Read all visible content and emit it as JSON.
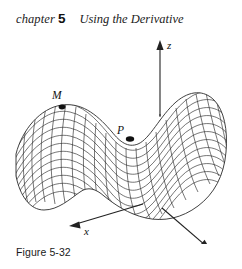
{
  "header": {
    "chapter_word": "chapter",
    "chapter_number": "5",
    "title": "Using the Derivative"
  },
  "figure": {
    "caption": "Figure 5-32",
    "axes": [
      {
        "name": "z-axis",
        "label": "z",
        "direction": "up"
      },
      {
        "name": "y-axis",
        "label": "y",
        "direction": "down-right"
      },
      {
        "name": "x-axis",
        "label": "x",
        "direction": "down-left"
      }
    ],
    "marked_points": [
      {
        "name": "local-maximum-point",
        "label": "M"
      },
      {
        "name": "saddle-point",
        "label": "P"
      }
    ],
    "surface": {
      "name": "saddle-surface-mesh",
      "style": "wireframe",
      "line_color": "#2b2b2b",
      "fill_color": "#ffffff"
    },
    "hidden_axis_style": "dashed"
  },
  "colors": {
    "ink": "#1a1a1a",
    "mesh": "#2b2b2b",
    "background": "#ffffff"
  }
}
